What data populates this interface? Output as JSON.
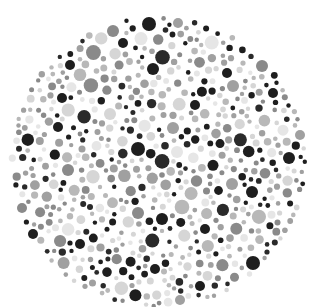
{
  "image": {
    "description": "Grayscale Ishihara-style color vision test plate composed of dots",
    "width": 314,
    "height": 307,
    "background": "#ffffff"
  },
  "plate": {
    "center": [
      158,
      162
    ],
    "radius_x": 150,
    "radius_y": 147,
    "palette": [
      "#1e1e1e",
      "#2a2a2a",
      "#8a8a8a",
      "#a0a0a0",
      "#b8b8b8",
      "#d6d6d6",
      "#e6e6e6"
    ],
    "weights": [
      0.16,
      0.12,
      0.16,
      0.18,
      0.14,
      0.14,
      0.1
    ],
    "seed": 7,
    "min_r": 2.2,
    "max_r": 7.5,
    "attempts": 9000,
    "gap": 1.3,
    "key_dots": [
      {
        "x": 149,
        "y": 24,
        "r": 7,
        "c": "#1e1e1e"
      },
      {
        "x": 113,
        "y": 31,
        "r": 6,
        "c": "#8a8a8a"
      },
      {
        "x": 178,
        "y": 23,
        "r": 5,
        "c": "#a0a0a0"
      },
      {
        "x": 123,
        "y": 43,
        "r": 5,
        "c": "#1e1e1e"
      },
      {
        "x": 153,
        "y": 69,
        "r": 6,
        "c": "#1e1e1e"
      },
      {
        "x": 70,
        "y": 65,
        "r": 5,
        "c": "#1e1e1e"
      },
      {
        "x": 262,
        "y": 66,
        "r": 6,
        "c": "#8a8a8a"
      },
      {
        "x": 227,
        "y": 73,
        "r": 5,
        "c": "#1e1e1e"
      },
      {
        "x": 62,
        "y": 98,
        "r": 5,
        "c": "#1e1e1e"
      },
      {
        "x": 233,
        "y": 86,
        "r": 6,
        "c": "#a0a0a0"
      },
      {
        "x": 273,
        "y": 93,
        "r": 5,
        "c": "#1e1e1e"
      },
      {
        "x": 110,
        "y": 114,
        "r": 6,
        "c": "#d6d6d6"
      },
      {
        "x": 195,
        "y": 105,
        "r": 5,
        "c": "#1e1e1e"
      },
      {
        "x": 173,
        "y": 128,
        "r": 6,
        "c": "#a0a0a0"
      },
      {
        "x": 138,
        "y": 149,
        "r": 7,
        "c": "#1e1e1e"
      },
      {
        "x": 177,
        "y": 152,
        "r": 6,
        "c": "#e6e6e6"
      },
      {
        "x": 58,
        "y": 127,
        "r": 5,
        "c": "#1e1e1e"
      },
      {
        "x": 68,
        "y": 170,
        "r": 6,
        "c": "#8a8a8a"
      },
      {
        "x": 289,
        "y": 158,
        "r": 6,
        "c": "#1e1e1e"
      },
      {
        "x": 252,
        "y": 192,
        "r": 6,
        "c": "#1e1e1e"
      },
      {
        "x": 232,
        "y": 184,
        "r": 6,
        "c": "#a0a0a0"
      },
      {
        "x": 162,
        "y": 219,
        "r": 6,
        "c": "#1e1e1e"
      },
      {
        "x": 138,
        "y": 213,
        "r": 6,
        "c": "#8a8a8a"
      },
      {
        "x": 33,
        "y": 234,
        "r": 5,
        "c": "#1e1e1e"
      },
      {
        "x": 253,
        "y": 263,
        "r": 7,
        "c": "#1e1e1e"
      },
      {
        "x": 205,
        "y": 229,
        "r": 5,
        "c": "#1e1e1e"
      },
      {
        "x": 80,
        "y": 244,
        "r": 5,
        "c": "#1e1e1e"
      },
      {
        "x": 155,
        "y": 269,
        "r": 5,
        "c": "#1e1e1e"
      },
      {
        "x": 180,
        "y": 300,
        "r": 5,
        "c": "#a0a0a0"
      },
      {
        "x": 200,
        "y": 286,
        "r": 5,
        "c": "#1e1e1e"
      },
      {
        "x": 22,
        "y": 208,
        "r": 5,
        "c": "#8a8a8a"
      },
      {
        "x": 300,
        "y": 135,
        "r": 5,
        "c": "#a0a0a0"
      }
    ]
  }
}
